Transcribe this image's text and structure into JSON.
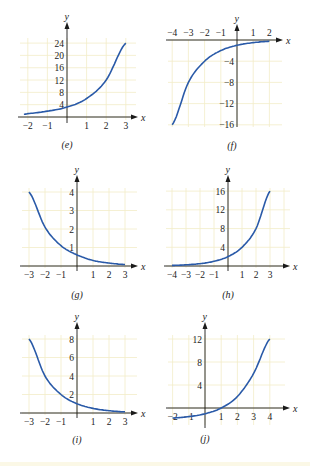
{
  "chart_data": [
    {
      "id": "e",
      "type": "line",
      "caption": "(e)",
      "xlabel": "x",
      "ylabel": "y",
      "xlim": [
        -2.2,
        3.3
      ],
      "ylim": [
        0,
        26
      ],
      "x_ticks": [
        -2,
        -1,
        1,
        2,
        3
      ],
      "y_ticks": [
        4,
        8,
        12,
        16,
        20,
        24
      ],
      "x": [
        -2.2,
        -2,
        -1,
        0,
        1,
        2,
        3
      ],
      "y": [
        0.9,
        1.1,
        1.9,
        3.2,
        6.0,
        12.0,
        24.0
      ],
      "grid": true
    },
    {
      "id": "f",
      "type": "line",
      "caption": "(f)",
      "xlabel": "x",
      "ylabel": "y",
      "xlim": [
        -4.2,
        2.6
      ],
      "ylim": [
        -16.5,
        1
      ],
      "x_ticks": [
        -4,
        -3,
        -2,
        -1,
        1,
        2
      ],
      "y_ticks": [
        -4,
        -8,
        -12,
        -16
      ],
      "x": [
        -4,
        -3,
        -2,
        -1,
        0,
        1,
        2
      ],
      "y": [
        -16,
        -8,
        -4,
        -2,
        -1,
        -0.5,
        -0.25
      ],
      "grid": true
    },
    {
      "id": "g",
      "type": "line",
      "caption": "(g)",
      "xlabel": "x",
      "ylabel": "y",
      "xlim": [
        -3.3,
        3.5
      ],
      "ylim": [
        0,
        4.5
      ],
      "x_ticks": [
        -3,
        -2,
        -1,
        1,
        2,
        3
      ],
      "y_ticks": [
        1,
        2,
        3,
        4
      ],
      "x": [
        -3,
        -2,
        -1,
        0,
        1,
        2,
        3
      ],
      "y": [
        4.0,
        2.1,
        1.1,
        0.6,
        0.3,
        0.16,
        0.08
      ],
      "grid": true
    },
    {
      "id": "h",
      "type": "line",
      "caption": "(h)",
      "xlabel": "x",
      "ylabel": "y",
      "xlim": [
        -4.3,
        3.5
      ],
      "ylim": [
        0,
        18
      ],
      "x_ticks": [
        -4,
        -3,
        -2,
        -1,
        1,
        2,
        3
      ],
      "y_ticks": [
        4,
        8,
        12,
        16
      ],
      "x": [
        -4,
        -3,
        -2,
        -1,
        0,
        1,
        2,
        3
      ],
      "y": [
        0.125,
        0.25,
        0.5,
        1,
        2,
        4,
        8,
        16
      ],
      "grid": true
    },
    {
      "id": "i",
      "type": "line",
      "caption": "(i)",
      "xlabel": "x",
      "ylabel": "y",
      "xlim": [
        -3.3,
        3.5
      ],
      "ylim": [
        0,
        9
      ],
      "x_ticks": [
        -3,
        -2,
        -1,
        1,
        2,
        3
      ],
      "y_ticks": [
        2,
        4,
        6,
        8
      ],
      "x": [
        -3,
        -2,
        -1,
        0,
        1,
        2,
        3
      ],
      "y": [
        8,
        4,
        2,
        1,
        0.5,
        0.25,
        0.125
      ],
      "grid": true
    },
    {
      "id": "j",
      "type": "line",
      "caption": "(j)",
      "xlabel": "x",
      "ylabel": "y",
      "xlim": [
        -2.2,
        4.5
      ],
      "ylim": [
        -2,
        14
      ],
      "x_ticks": [
        -2,
        -1,
        1,
        2,
        3,
        4
      ],
      "y_ticks": [
        4,
        8,
        12
      ],
      "x": [
        -2,
        -1,
        0,
        1,
        2,
        3,
        4
      ],
      "y": [
        -1.75,
        -1.5,
        -1,
        0,
        2,
        6,
        12
      ],
      "grid": true
    }
  ],
  "style": {
    "curve_color": "#2a5aa8",
    "grid_color": "#f3ecc8",
    "axis_color": "#1a1a1a"
  }
}
